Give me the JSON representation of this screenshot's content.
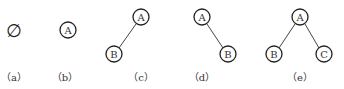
{
  "figure": {
    "panels": [
      {
        "id": "a",
        "caption": "（a）",
        "symbol": "∅",
        "description": "empty tree"
      },
      {
        "id": "b",
        "caption": "（b）",
        "nodes": [
          {
            "label": "A"
          }
        ],
        "description": "single root node"
      },
      {
        "id": "c",
        "caption": "（c）",
        "nodes": [
          {
            "label": "A"
          },
          {
            "label": "B"
          }
        ],
        "edges": [
          [
            "A",
            "B"
          ]
        ],
        "description": "root with left child only"
      },
      {
        "id": "d",
        "caption": "（d）",
        "nodes": [
          {
            "label": "A"
          },
          {
            "label": "B"
          }
        ],
        "edges": [
          [
            "A",
            "B"
          ]
        ],
        "description": "root with right child only"
      },
      {
        "id": "e",
        "caption": "（e）",
        "nodes": [
          {
            "label": "A"
          },
          {
            "label": "B"
          },
          {
            "label": "C"
          }
        ],
        "edges": [
          [
            "A",
            "B"
          ],
          [
            "A",
            "C"
          ]
        ],
        "description": "root with left and right children"
      }
    ]
  },
  "colors": {
    "stroke": "#222222",
    "text": "#333333",
    "background": "#ffffff"
  }
}
